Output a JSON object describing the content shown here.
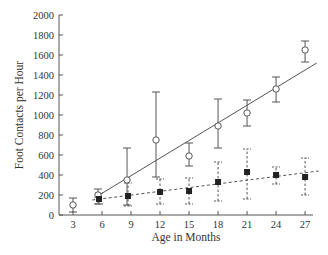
{
  "chart_data": {
    "type": "scatter",
    "title": "",
    "xlabel": "Age in Months",
    "ylabel": "Foot Contacts per Hour",
    "xlim": [
      1.5,
      28.5
    ],
    "ylim": [
      0,
      2000
    ],
    "x_ticks": [
      3,
      6,
      9,
      12,
      15,
      18,
      21,
      24,
      27
    ],
    "y_ticks": [
      0,
      200,
      400,
      600,
      800,
      1000,
      1200,
      1400,
      1600,
      1800,
      2000
    ],
    "grid": false,
    "legend": null,
    "series": [
      {
        "name": "open-circles",
        "marker": "open-circle",
        "errorbar_style": "solid",
        "points": [
          {
            "x": 3,
            "y": 100,
            "lo": 30,
            "hi": 170
          },
          {
            "x": 6,
            "y": 200,
            "lo": 110,
            "hi": 260
          },
          {
            "x": 9,
            "y": 350,
            "lo": 100,
            "hi": 670
          },
          {
            "x": 12,
            "y": 750,
            "lo": 380,
            "hi": 1230
          },
          {
            "x": 15,
            "y": 590,
            "lo": 490,
            "hi": 720
          },
          {
            "x": 18,
            "y": 890,
            "lo": 670,
            "hi": 1160
          },
          {
            "x": 21,
            "y": 1020,
            "lo": 890,
            "hi": 1150
          },
          {
            "x": 24,
            "y": 1260,
            "lo": 1130,
            "hi": 1380
          },
          {
            "x": 27,
            "y": 1650,
            "lo": 1530,
            "hi": 1740
          }
        ],
        "fit_line": {
          "style": "solid",
          "x0": 5.2,
          "y0": 170,
          "x1": 28.2,
          "y1": 1520
        }
      },
      {
        "name": "filled-squares",
        "marker": "filled-square",
        "errorbar_style": "dashed",
        "points": [
          {
            "x": 6,
            "y": 160,
            "lo": 110,
            "hi": 220
          },
          {
            "x": 9,
            "y": 190,
            "lo": 90,
            "hi": 320
          },
          {
            "x": 12,
            "y": 230,
            "lo": 110,
            "hi": 360
          },
          {
            "x": 15,
            "y": 240,
            "lo": 110,
            "hi": 370
          },
          {
            "x": 18,
            "y": 330,
            "lo": 140,
            "hi": 530
          },
          {
            "x": 21,
            "y": 430,
            "lo": 160,
            "hi": 660
          },
          {
            "x": 24,
            "y": 400,
            "lo": 310,
            "hi": 480
          },
          {
            "x": 27,
            "y": 380,
            "lo": 200,
            "hi": 570
          }
        ],
        "fit_line": {
          "style": "dashed",
          "x0": 5.0,
          "y0": 150,
          "x1": 28.4,
          "y1": 440
        }
      }
    ]
  }
}
